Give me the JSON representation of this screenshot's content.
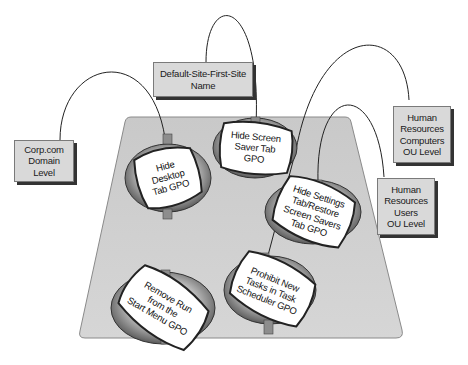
{
  "diagram": {
    "title": "",
    "containers": [
      {
        "id": "domain",
        "label": "Corp.com\nDomain\nLevel"
      },
      {
        "id": "site",
        "label": "Default-Site-First-Site\nName"
      },
      {
        "id": "hr_computers",
        "label": "Human\nResources\nComputers\nOU Level"
      },
      {
        "id": "hr_users",
        "label": "Human\nResources\nUsers\nOU Level"
      }
    ],
    "gpos": [
      {
        "id": "gpo_desktop",
        "label": "Hide\nDesktop\nTab GPO",
        "linked_to": "domain"
      },
      {
        "id": "gpo_screensaver",
        "label": "Hide Screen\nSaver Tab\nGPO",
        "linked_to": "site"
      },
      {
        "id": "gpo_settings",
        "label": "Hide Settings\nTab/Restore\nScreen Savers\nTab GPO",
        "linked_to": "hr_users"
      },
      {
        "id": "gpo_taskscheduler",
        "label": "Prohibit New\nTasks in Task\nScheduler GPO",
        "linked_to": "hr_computers"
      },
      {
        "id": "gpo_run",
        "label": "Remove Run\nfrom the\nStart Menu GPO",
        "linked_to": null
      }
    ],
    "colors": {
      "tray_fill": "#cfcfcf",
      "tray_stroke": "#8a8a8a",
      "box_fill": "#d9d9d9",
      "box_shadow": "#333333",
      "ring_dark": "#5e5e5e",
      "ring_light": "#e6e6e6",
      "tag_fill": "#ffffff",
      "line": "#222222"
    }
  }
}
